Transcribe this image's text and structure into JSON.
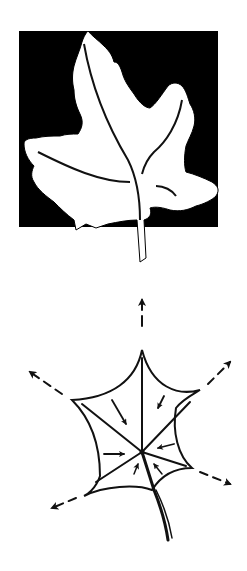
{
  "figures": [
    {
      "id": "leaf-silhouette",
      "description": "White maple-type leaf silhouette with veins on a black square background",
      "colors": {
        "background": "#000000",
        "leaf": "#ffffff",
        "vein": "#111111"
      }
    },
    {
      "id": "leaf-force-diagram",
      "description": "Schematic leaf outline with radiating dashed outward arrows at lobe tips and inward arrows toward the central vein junction",
      "colors": {
        "stroke": "#111111",
        "background": "#ffffff"
      },
      "outward_arrows": 5,
      "inward_arrows": 6
    }
  ]
}
